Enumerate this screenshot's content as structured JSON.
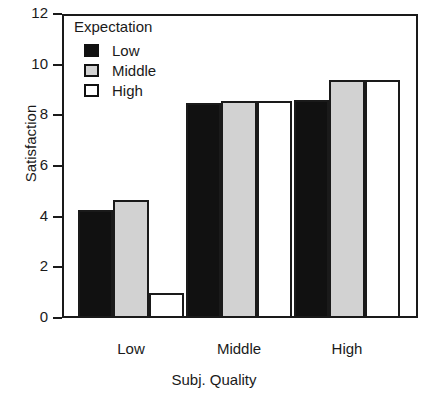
{
  "chart_data": {
    "type": "bar",
    "title": "",
    "xlabel": "Subj. Quality",
    "ylabel": "Satisfaction",
    "categories": [
      "Low",
      "Middle",
      "High"
    ],
    "series": [
      {
        "name": "Low",
        "color": "#111111",
        "values": [
          4.25,
          8.5,
          8.6
        ]
      },
      {
        "name": "Middle",
        "color": "#d2d2d2",
        "values": [
          4.65,
          8.55,
          9.4
        ]
      },
      {
        "name": "High",
        "color": "#ffffff",
        "values": [
          1.0,
          8.55,
          9.4
        ]
      }
    ],
    "ylim": [
      0,
      12
    ],
    "yticks": [
      0,
      2,
      4,
      6,
      8,
      10,
      12
    ],
    "ytick_labels": [
      "0",
      "2",
      "4",
      "6",
      "8",
      "10",
      "12"
    ],
    "grid": false,
    "legend": {
      "title": "Expectation",
      "position": "upper-left-inside",
      "entries": [
        {
          "label": "Low",
          "color": "#111111"
        },
        {
          "label": "Middle",
          "color": "#d2d2d2"
        },
        {
          "label": "High",
          "color": "#ffffff"
        }
      ]
    },
    "frame": {
      "edge_color": "#1a1a1a"
    }
  }
}
